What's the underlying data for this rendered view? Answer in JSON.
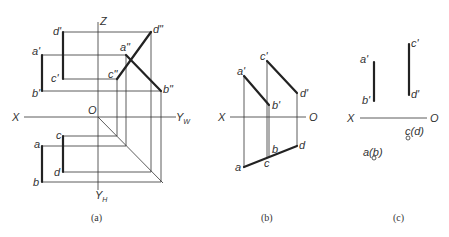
{
  "figure": {
    "panels": [
      {
        "id": "a",
        "caption": "(a)",
        "axes": {
          "x": "X",
          "z": "Z",
          "yw": "Y",
          "yw_sub": "W",
          "yh": "Y",
          "yh_sub": "H",
          "origin": "O"
        },
        "labels": {
          "d_prime": "d'",
          "a_prime": "a'",
          "c_prime": "c'",
          "b_prime": "b'",
          "d_dprime": "d\"",
          "a_dprime": "a\"",
          "c_dprime": "c\"",
          "b_dprime": "b\"",
          "a": "a",
          "b": "b",
          "c": "c",
          "d": "d"
        }
      },
      {
        "id": "b",
        "caption": "(b)",
        "axes": {
          "x": "X",
          "origin": "O"
        },
        "labels": {
          "a_prime": "a'",
          "b_prime": "b'",
          "c_prime": "c'",
          "d_prime": "d'",
          "a": "a",
          "b": "b",
          "c": "c",
          "d": "d"
        }
      },
      {
        "id": "c",
        "caption": "(c)",
        "axes": {
          "x": "X",
          "origin": "O"
        },
        "labels": {
          "a_prime": "a'",
          "b_prime": "b'",
          "c_prime": "c'",
          "d_prime": "d'",
          "cd": "c(d)",
          "ab": "a(b)"
        }
      }
    ]
  }
}
